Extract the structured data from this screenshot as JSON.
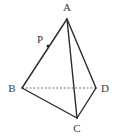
{
  "figure": {
    "background_color": "#ffffff",
    "stroke_color": "#2b2b2b",
    "hidden_edge_color": "#6b6b6b",
    "label_color": "#3a3a3a",
    "vertices": [
      {
        "id": "A",
        "label": "A",
        "x": 67,
        "y": 19,
        "label_x": 67,
        "label_y": 11
      },
      {
        "id": "B",
        "label": "B",
        "x": 22,
        "y": 88,
        "label_x": 12,
        "label_y": 92
      },
      {
        "id": "C",
        "label": "C",
        "x": 77,
        "y": 118,
        "label_x": 77,
        "label_y": 132
      },
      {
        "id": "D",
        "label": "D",
        "x": 96,
        "y": 88,
        "label_x": 105,
        "label_y": 92
      }
    ],
    "points": [
      {
        "id": "P",
        "label": "P",
        "x": 48,
        "y": 46,
        "label_x": 40,
        "label_y": 43,
        "on_edge": "AB"
      }
    ],
    "edges": [
      {
        "id": "AB",
        "from": "A",
        "to": "B",
        "style": "solid"
      },
      {
        "id": "AC",
        "from": "A",
        "to": "C",
        "style": "solid"
      },
      {
        "id": "AD",
        "from": "A",
        "to": "D",
        "style": "solid"
      },
      {
        "id": "BC",
        "from": "B",
        "to": "C",
        "style": "solid"
      },
      {
        "id": "CD",
        "from": "C",
        "to": "D",
        "style": "solid"
      },
      {
        "id": "BD",
        "from": "B",
        "to": "D",
        "style": "dashed"
      }
    ]
  }
}
